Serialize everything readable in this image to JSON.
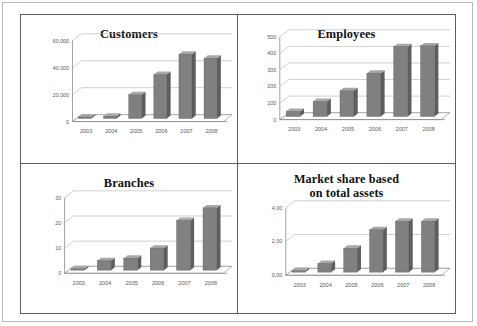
{
  "figure": {
    "panel_count": 4,
    "layout": "2x2",
    "background": "#ffffff",
    "frame_color": "#5c5c5c",
    "bar_color": "#808080",
    "bar_top_color": "#a8a8a8",
    "bar_side_color": "#5e5e5e",
    "grid_color": "#b0b0b0"
  },
  "chart_data": [
    {
      "id": "customers",
      "type": "bar",
      "title": "Customers",
      "xlabel": "",
      "ylabel": "",
      "categories": [
        "2003",
        "2004",
        "2005",
        "2006",
        "2007",
        "2008"
      ],
      "values": [
        500,
        4000,
        20000,
        35000,
        50000,
        47000
      ],
      "ylim": [
        0,
        60000
      ],
      "yticks": [
        0,
        20000,
        40000,
        60000
      ],
      "ytick_labels": [
        "0",
        "20.000",
        "40.000",
        "60.000"
      ],
      "grid": true,
      "legend": "none",
      "style": "3d-column"
    },
    {
      "id": "employees",
      "type": "bar",
      "title": "Employees",
      "xlabel": "",
      "ylabel": "",
      "categories": [
        "2003",
        "2004",
        "2005",
        "2006",
        "2007",
        "2008"
      ],
      "values": [
        50,
        110,
        175,
        280,
        440,
        445
      ],
      "ylim": [
        0,
        500
      ],
      "yticks": [
        0,
        100,
        200,
        300,
        400,
        500
      ],
      "ytick_labels": [
        "0",
        "100",
        "200",
        "300",
        "400",
        "500"
      ],
      "grid": true,
      "legend": "none",
      "style": "3d-column"
    },
    {
      "id": "branches",
      "type": "bar",
      "title": "Branches",
      "xlabel": "",
      "ylabel": "",
      "categories": [
        "2003",
        "2004",
        "2005",
        "2006",
        "2007",
        "2008"
      ],
      "values": [
        1,
        5,
        6,
        10,
        21,
        26
      ],
      "ylim": [
        0,
        30
      ],
      "yticks": [
        0,
        10,
        20,
        30
      ],
      "ytick_labels": [
        "0",
        "10",
        "20",
        "30"
      ],
      "grid": true,
      "legend": "none",
      "style": "3d-column"
    },
    {
      "id": "market-share",
      "type": "bar",
      "title": "Market share based on total assets",
      "title_lines": [
        "Market share based",
        "on total assets"
      ],
      "xlabel": "",
      "ylabel": "",
      "categories": [
        "2003",
        "2004",
        "2005",
        "2006",
        "2007",
        "2008"
      ],
      "values": [
        0.2,
        0.7,
        1.6,
        2.7,
        3.2,
        3.2
      ],
      "ylim": [
        0,
        4
      ],
      "yticks": [
        0,
        2,
        4
      ],
      "ytick_labels": [
        "0,00",
        "2,00",
        "4,00"
      ],
      "grid": true,
      "legend": "none",
      "style": "3d-column"
    }
  ]
}
